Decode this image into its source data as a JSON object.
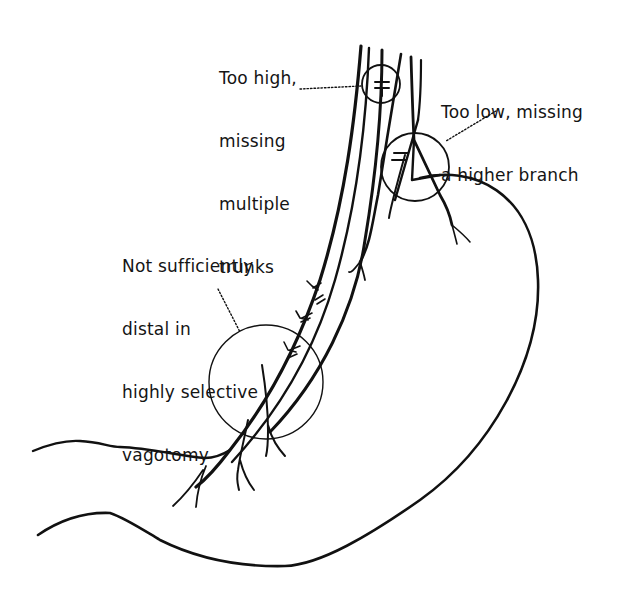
{
  "figure": {
    "type": "anatomical-diagram",
    "stroke_color": "#111111",
    "background_color": "#ffffff"
  },
  "annotations": [
    {
      "id": "too-high",
      "lines": [
        "Too high,",
        "missing",
        "multiple",
        "trunks"
      ],
      "target": "small circle around vagal trunks near esophagus top"
    },
    {
      "id": "too-low",
      "lines": [
        "Too low, missing",
        "a higher branch"
      ],
      "target": "circle around branching point at gastroesophageal junction"
    },
    {
      "id": "not-distal",
      "lines": [
        "Not sufficiently",
        "distal in",
        "highly selective",
        "vagotomy"
      ],
      "target": "large circle on lesser curvature near antrum"
    }
  ]
}
